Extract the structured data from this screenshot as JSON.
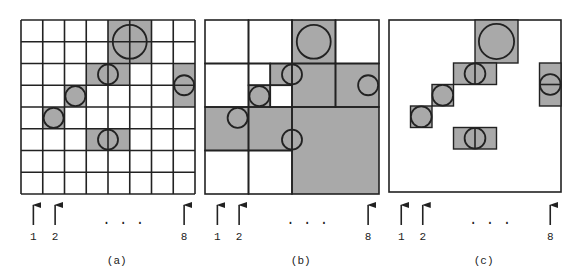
{
  "figure": {
    "grid_size": 8,
    "colors": {
      "fill": "#a9a9a9",
      "stroke": "#222222",
      "background": "#ffffff"
    },
    "circles": [
      {
        "cx": 5.0,
        "cy": 1.0,
        "r": 0.78
      },
      {
        "cx": 4.0,
        "cy": 2.5,
        "r": 0.46
      },
      {
        "cx": 7.5,
        "cy": 3.0,
        "r": 0.46
      },
      {
        "cx": 2.5,
        "cy": 3.5,
        "r": 0.46
      },
      {
        "cx": 1.5,
        "cy": 4.5,
        "r": 0.46
      },
      {
        "cx": 4.0,
        "cy": 5.5,
        "r": 0.46
      }
    ],
    "panels": [
      {
        "id": "a",
        "caption": "(a)",
        "origin_x": 21,
        "origin_y": 20,
        "cell": 21.75,
        "type": "uniform-grid",
        "shaded": [
          [
            4,
            0,
            1,
            1
          ],
          [
            5,
            0,
            1,
            1
          ],
          [
            4,
            1,
            1,
            1
          ],
          [
            5,
            1,
            1,
            1
          ],
          [
            3,
            2,
            1,
            1
          ],
          [
            4,
            2,
            1,
            1
          ],
          [
            7,
            2,
            1,
            1
          ],
          [
            7,
            3,
            1,
            1
          ],
          [
            2,
            3,
            1,
            1
          ],
          [
            1,
            4,
            1,
            1
          ],
          [
            3,
            5,
            1,
            1
          ],
          [
            4,
            5,
            1,
            1
          ]
        ],
        "arrows": {
          "labels": [
            "1",
            "2",
            "8"
          ],
          "cols": [
            0,
            1,
            7
          ]
        },
        "ellipsis": ". . ."
      },
      {
        "id": "b",
        "caption": "(b)",
        "origin_x": 205,
        "origin_y": 20,
        "cell": 21.75,
        "type": "quadtree",
        "blocks": [
          [
            0,
            0,
            2,
            0
          ],
          [
            2,
            0,
            2,
            0
          ],
          [
            4,
            0,
            2,
            1
          ],
          [
            6,
            0,
            2,
            0
          ],
          [
            0,
            2,
            2,
            0
          ],
          [
            2,
            2,
            1,
            0
          ],
          [
            3,
            2,
            1,
            1
          ],
          [
            2,
            3,
            1,
            1
          ],
          [
            3,
            3,
            1,
            0
          ],
          [
            4,
            2,
            2,
            1
          ],
          [
            6,
            2,
            2,
            1
          ],
          [
            0,
            4,
            2,
            1
          ],
          [
            2,
            4,
            2,
            1
          ],
          [
            0,
            6,
            2,
            0
          ],
          [
            2,
            6,
            2,
            0
          ],
          [
            4,
            4,
            4,
            1
          ]
        ],
        "arrows": {
          "labels": [
            "1",
            "2",
            "8"
          ],
          "cols": [
            0,
            1,
            7
          ]
        },
        "ellipsis": ". . ."
      },
      {
        "id": "c",
        "caption": "(c)",
        "origin_x": 389,
        "origin_y": 20,
        "cell": 21.5,
        "type": "bounding-boxes",
        "boxes": [
          [
            4,
            0,
            2,
            2,
            "none"
          ],
          [
            3,
            2,
            2,
            1,
            "v"
          ],
          [
            7,
            2,
            1,
            2,
            "h"
          ],
          [
            2,
            3,
            1,
            1,
            "none"
          ],
          [
            1,
            4,
            1,
            1,
            "none"
          ],
          [
            3,
            5,
            2,
            1,
            "v"
          ]
        ],
        "arrows": {
          "labels": [
            "1",
            "2",
            "8"
          ],
          "cols": [
            0,
            1,
            7
          ]
        },
        "ellipsis": ". . ."
      }
    ]
  }
}
